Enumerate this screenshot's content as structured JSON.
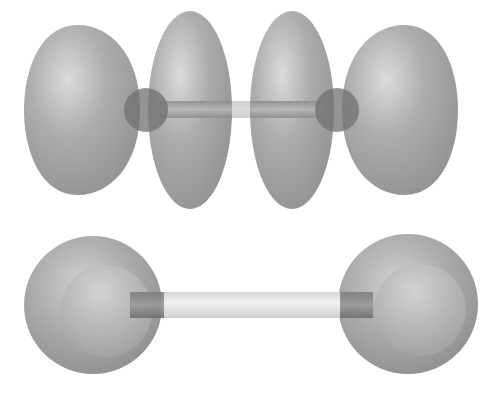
{
  "diagram": {
    "kind": "molecular-orbital-illustration",
    "colors": {
      "background": "#ffffff",
      "lobe_fill": "#9a9a9a",
      "lobe_highlight": "#d8d8d8",
      "lobe_shadow": "#7e7e7e",
      "nucleus": "#6e6e6e",
      "bond": "#9c9c9c",
      "bond_light": "#e4e4e4"
    },
    "top_molecule": {
      "description": "Antibonding-style orbital with four lobes and two nuclei",
      "lobes": [
        {
          "id": "outer-left",
          "cx": 82,
          "cy": 110,
          "rx": 58,
          "ry": 86,
          "shape": "half-lens-left"
        },
        {
          "id": "inner-left",
          "cx": 188,
          "cy": 110,
          "rx": 42,
          "ry": 99,
          "shape": "ellipse"
        },
        {
          "id": "inner-right",
          "cx": 292,
          "cy": 110,
          "rx": 42,
          "ry": 99,
          "shape": "ellipse"
        },
        {
          "id": "outer-right",
          "cx": 398,
          "cy": 110,
          "rx": 58,
          "ry": 86,
          "shape": "half-lens-right"
        }
      ],
      "nuclei": [
        {
          "id": "nucleus-left",
          "cx": 146,
          "cy": 110,
          "r": 22
        },
        {
          "id": "nucleus-right",
          "cx": 338,
          "cy": 110,
          "r": 22
        }
      ],
      "bond": {
        "x1": 166,
        "x2": 318,
        "cy": 110,
        "thickness": 16
      }
    },
    "bottom_molecule": {
      "description": "Two spherical orbitals joined by a bond",
      "spheres": [
        {
          "id": "sphere-left",
          "cx": 93,
          "cy": 305,
          "r": 69,
          "inner_cx": 106,
          "inner_cy": 310,
          "inner_r": 45
        },
        {
          "id": "sphere-right",
          "cx": 408,
          "cy": 304,
          "r": 70,
          "inner_cx": 420,
          "inner_cy": 310,
          "inner_r": 45
        }
      ],
      "bond": {
        "x1": 130,
        "x2": 372,
        "cy": 305,
        "thickness": 27
      }
    }
  }
}
